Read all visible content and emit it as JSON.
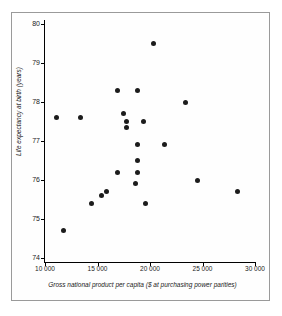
{
  "chart_data": {
    "type": "scatter",
    "title": "",
    "xlabel": "Gross national product per capita ($ at purchasing power parities)",
    "ylabel": "Life expectancy at birth (years)",
    "xlim": [
      10000,
      30000
    ],
    "ylim": [
      74,
      80
    ],
    "grid": false,
    "legend": "none",
    "xticks": [
      10000,
      15000,
      20000,
      25000,
      30000
    ],
    "xtick_labels": [
      "10 000",
      "15 000",
      "20 000",
      "25 000",
      "30 000"
    ],
    "yticks": [
      74,
      75,
      76,
      77,
      78,
      79,
      80
    ],
    "ytick_labels": [
      "74",
      "75",
      "76",
      "77",
      "78",
      "79",
      "80"
    ],
    "marker": "filled-circle",
    "marker_color": "#1c1c1c",
    "points": [
      {
        "x": 11100,
        "y": 77.6
      },
      {
        "x": 11800,
        "y": 74.7
      },
      {
        "x": 13400,
        "y": 77.6
      },
      {
        "x": 14400,
        "y": 75.4
      },
      {
        "x": 15400,
        "y": 75.6
      },
      {
        "x": 15900,
        "y": 75.7
      },
      {
        "x": 16900,
        "y": 76.2
      },
      {
        "x": 16900,
        "y": 78.3
      },
      {
        "x": 17500,
        "y": 77.7
      },
      {
        "x": 17800,
        "y": 77.5
      },
      {
        "x": 17800,
        "y": 77.35
      },
      {
        "x": 18600,
        "y": 75.9
      },
      {
        "x": 18800,
        "y": 76.2
      },
      {
        "x": 18800,
        "y": 76.5
      },
      {
        "x": 18800,
        "y": 76.9
      },
      {
        "x": 18800,
        "y": 78.3
      },
      {
        "x": 19400,
        "y": 77.5
      },
      {
        "x": 19600,
        "y": 75.4
      },
      {
        "x": 20300,
        "y": 79.5
      },
      {
        "x": 21400,
        "y": 76.9
      },
      {
        "x": 23400,
        "y": 78.0
      },
      {
        "x": 24500,
        "y": 76.0
      },
      {
        "x": 28300,
        "y": 75.7
      }
    ]
  }
}
